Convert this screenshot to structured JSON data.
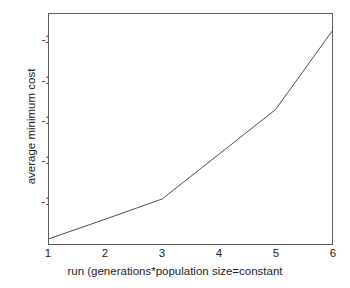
{
  "chart_data": {
    "type": "line",
    "title": "",
    "xlabel": "run (generations*population size=constant",
    "ylabel": "average minimum cost",
    "x": [
      1,
      2,
      3,
      4,
      5,
      6
    ],
    "values": [
      -16.86,
      -16.37,
      -15.87,
      -14.76,
      -13.65,
      -11.7
    ],
    "series": [
      {
        "name": "average minimum cost",
        "values": [
          -16.86,
          -16.37,
          -15.87,
          -14.76,
          -13.65,
          -11.7
        ]
      }
    ],
    "xtick_labels": [
      "1",
      "2",
      "3",
      "4",
      "5",
      "6"
    ],
    "ytick_labels": [
      "-12",
      "-13",
      "-14",
      "-15",
      "-16"
    ],
    "ytick_values": [
      -12,
      -13,
      -14,
      -15,
      -16
    ],
    "xlim": [
      1,
      6
    ],
    "ylim": [
      -16.99,
      -11.27
    ],
    "grid": false,
    "legend": false,
    "legend_position": "none",
    "line_color": "#4d4d4d",
    "axis_color": "#5a5a5a",
    "background_color": "#ffffff"
  }
}
